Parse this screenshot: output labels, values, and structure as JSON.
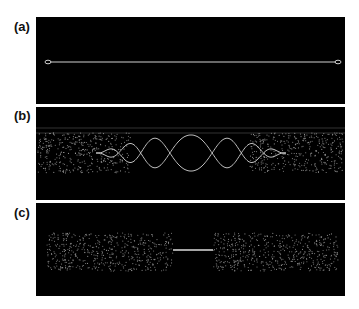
{
  "figure": {
    "panels": [
      {
        "id": "a",
        "label": "(a)",
        "description": "single straight strand with end loops"
      },
      {
        "id": "b",
        "label": "(b)",
        "description": "two intertwined oscillating strands with dense dotted regions at both ends"
      },
      {
        "id": "c",
        "label": "(c)",
        "description": "two dense dotted blocks connected by a thin straight strand"
      }
    ],
    "colors": {
      "background": "#000000",
      "strand": "#cfcfcf",
      "page": "#ffffff"
    }
  }
}
